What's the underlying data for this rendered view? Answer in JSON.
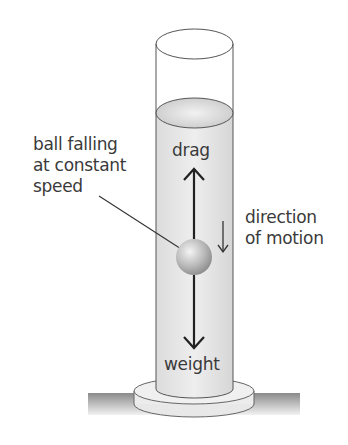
{
  "diagram": {
    "labels": {
      "ball": [
        "ball falling",
        "at constant",
        "speed"
      ],
      "drag": "drag",
      "direction": [
        "direction",
        "of motion"
      ],
      "weight": "weight"
    },
    "forces": [
      {
        "name": "drag",
        "direction": "up"
      },
      {
        "name": "weight",
        "direction": "down"
      }
    ],
    "colors": {
      "liquid": "#e6e6e6",
      "outline": "#555555",
      "arrow": "#222222",
      "text": "#3a3a3a"
    }
  }
}
